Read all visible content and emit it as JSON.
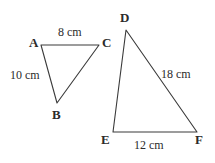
{
  "figure": {
    "background_color": "#ffffff",
    "stroke_color": "#3a3a3a",
    "text_color": "#2b2b2b",
    "triangles": [
      {
        "name": "triangle-abc",
        "vertices": [
          {
            "label": "A",
            "x": 41,
            "y": 45
          },
          {
            "label": "C",
            "x": 99,
            "y": 45
          },
          {
            "label": "B",
            "x": 57,
            "y": 103
          }
        ],
        "measures": [
          {
            "side": "AC",
            "text": "8 cm"
          },
          {
            "side": "AB",
            "text": "10 cm"
          }
        ]
      },
      {
        "name": "triangle-def",
        "vertices": [
          {
            "label": "D",
            "x": 126,
            "y": 30
          },
          {
            "label": "E",
            "x": 113,
            "y": 132
          },
          {
            "label": "F",
            "x": 197,
            "y": 132
          }
        ],
        "measures": [
          {
            "side": "DF",
            "text": "18 cm"
          },
          {
            "side": "EF",
            "text": "12 cm"
          }
        ]
      }
    ],
    "labels": {
      "vertex_a": "A",
      "vertex_b": "B",
      "vertex_c": "C",
      "vertex_d": "D",
      "vertex_e": "E",
      "vertex_f": "F",
      "side_ac": "8 cm",
      "side_ab": "10 cm",
      "side_df": "18 cm",
      "side_ef": "12 cm"
    }
  }
}
